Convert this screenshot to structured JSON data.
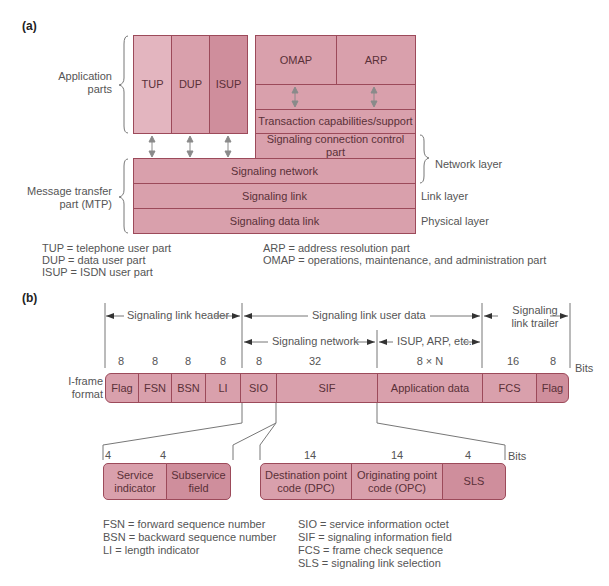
{
  "part_a": {
    "label": "(a)",
    "application_parts_label": "Application\nparts",
    "mtp_label": "Message transfer\npart (MTP)",
    "user_parts": [
      "TUP",
      "DUP",
      "ISUP"
    ],
    "top_right": [
      "OMAP",
      "ARP"
    ],
    "tcap": "Transaction capabilities/support",
    "sccp": "Signaling connection control part",
    "mtp_layers": [
      "Signaling network",
      "Signaling link",
      "Signaling data link"
    ],
    "layer_labels": {
      "network": "Network layer",
      "link": "Link layer",
      "physical": "Physical layer"
    },
    "legend_left": [
      "TUP = telephone user part",
      "DUP = data user part",
      "ISUP = ISDN user part"
    ],
    "legend_right": [
      "ARP = address resolution part",
      "OMAP = operations, maintenance, and administration part"
    ]
  },
  "part_b": {
    "label": "(b)",
    "frame_label": "I-frame\nformat",
    "spans": {
      "header": "Signaling link header",
      "user_data": "Signaling link user data",
      "trailer": "Signaling\nlink trailer",
      "network": "Signaling network",
      "isup": "ISUP, ARP, etc."
    },
    "bits_label": "Bits",
    "fields": [
      {
        "name": "Flag",
        "bits": "8"
      },
      {
        "name": "FSN",
        "bits": "8"
      },
      {
        "name": "BSN",
        "bits": "8"
      },
      {
        "name": "LI",
        "bits": "8"
      },
      {
        "name": "SIO",
        "bits": "8"
      },
      {
        "name": "SIF",
        "bits": "32"
      },
      {
        "name": "Application data",
        "bits": "8 × N"
      },
      {
        "name": "FCS",
        "bits": "16"
      },
      {
        "name": "Flag",
        "bits": "8"
      }
    ],
    "sio_fields": [
      {
        "name": "Service\nindicator",
        "bits": "4"
      },
      {
        "name": "Subservice\nfield",
        "bits": "4"
      }
    ],
    "sif_fields": [
      {
        "name": "Destination point\ncode (DPC)",
        "bits": "14"
      },
      {
        "name": "Originating point\ncode (OPC)",
        "bits": "14"
      },
      {
        "name": "SLS",
        "bits": "4"
      }
    ],
    "legend_left": [
      "FSN = forward sequence number",
      "BSN = backward sequence number",
      "LI = length indicator"
    ],
    "legend_right": [
      "SIO = service information octet",
      "SIF = signaling information field",
      "FCS = frame check sequence",
      "SLS = signaling link selection"
    ]
  }
}
